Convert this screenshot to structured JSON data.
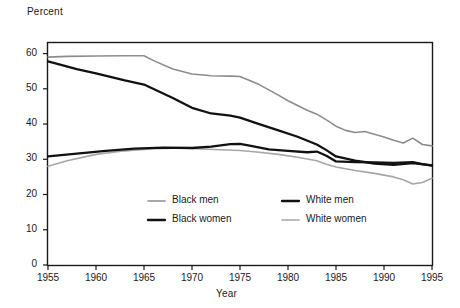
{
  "chart_data": {
    "type": "line",
    "title": "",
    "xlabel": "Year",
    "ylabel": "Percent",
    "xlim": [
      1955,
      1995
    ],
    "ylim": [
      0,
      63
    ],
    "xticks": [
      1955,
      1960,
      1965,
      1970,
      1975,
      1980,
      1985,
      1990,
      1995
    ],
    "yticks": [
      0,
      10,
      20,
      30,
      40,
      50,
      60
    ],
    "grid": false,
    "legend_position": "inside-lower-center",
    "frame": true,
    "series": [
      {
        "name": "Black men",
        "color": "#8c8c8c",
        "width": 1.6,
        "x": [
          1955,
          1957,
          1960,
          1963,
          1965,
          1966,
          1968,
          1970,
          1972,
          1974,
          1975,
          1977,
          1979,
          1980,
          1982,
          1983,
          1984,
          1985,
          1986,
          1987,
          1988,
          1989,
          1990,
          1991,
          1992,
          1993,
          1994,
          1995
        ],
        "values": [
          59.0,
          59.2,
          59.3,
          59.4,
          59.4,
          58.0,
          55.6,
          54.2,
          53.7,
          53.6,
          53.5,
          51.2,
          48.2,
          46.6,
          43.9,
          42.8,
          41.2,
          39.4,
          38.2,
          37.6,
          37.9,
          37.1,
          36.3,
          35.4,
          34.6,
          36.0,
          34.2,
          33.8
        ]
      },
      {
        "name": "Black women",
        "color": "#111111",
        "width": 2.3,
        "x": [
          1955,
          1958,
          1960,
          1963,
          1965,
          1968,
          1970,
          1972,
          1974,
          1975,
          1977,
          1979,
          1981,
          1983,
          1984,
          1985,
          1987,
          1989,
          1991,
          1993,
          1995
        ],
        "values": [
          57.8,
          55.6,
          54.4,
          52.4,
          51.2,
          47.4,
          44.6,
          43.0,
          42.4,
          41.8,
          40.0,
          38.2,
          36.4,
          34.2,
          32.6,
          30.8,
          29.6,
          28.8,
          28.4,
          28.9,
          28.3
        ]
      },
      {
        "name": "White men",
        "color": "#111111",
        "width": 2.3,
        "x": [
          1955,
          1958,
          1961,
          1964,
          1967,
          1970,
          1972,
          1974,
          1975,
          1976,
          1978,
          1980,
          1982,
          1983,
          1984,
          1985,
          1987,
          1989,
          1991,
          1993,
          1994,
          1995
        ],
        "values": [
          30.8,
          31.6,
          32.4,
          33.0,
          33.3,
          33.2,
          33.6,
          34.3,
          34.4,
          33.9,
          32.8,
          32.4,
          32.0,
          32.2,
          31.0,
          29.4,
          29.2,
          29.1,
          29.0,
          29.2,
          28.6,
          28.2
        ]
      },
      {
        "name": "White women",
        "color": "#a6a6a6",
        "width": 1.6,
        "x": [
          1955,
          1957,
          1960,
          1963,
          1966,
          1969,
          1971,
          1973,
          1975,
          1977,
          1979,
          1981,
          1983,
          1984,
          1985,
          1987,
          1989,
          1991,
          1992,
          1993,
          1994,
          1995
        ],
        "values": [
          28.0,
          29.6,
          31.4,
          32.4,
          33.0,
          33.2,
          32.9,
          32.7,
          32.5,
          32.0,
          31.4,
          30.6,
          29.6,
          28.6,
          27.8,
          26.8,
          26.0,
          25.0,
          24.2,
          23.0,
          23.4,
          24.6
        ]
      }
    ]
  },
  "legend": {
    "entries": [
      {
        "label": "Black men",
        "color": "#8c8c8c",
        "width": 1.6
      },
      {
        "label": "Black women",
        "color": "#111111",
        "width": 2.3
      },
      {
        "label": "White men",
        "color": "#111111",
        "width": 2.3
      },
      {
        "label": "White women",
        "color": "#a6a6a6",
        "width": 1.6
      }
    ]
  },
  "axes": {
    "y_title": "Percent",
    "x_title": "Year",
    "y_tick_labels": [
      "0",
      "10",
      "20",
      "30",
      "40",
      "50",
      "60"
    ],
    "x_tick_labels": [
      "1955",
      "1960",
      "1965",
      "1970",
      "1975",
      "1980",
      "1985",
      "1990",
      "1995"
    ]
  },
  "colors": {
    "frame": "#1a1a1a",
    "text": "#1a1a1a",
    "background": "#ffffff"
  }
}
